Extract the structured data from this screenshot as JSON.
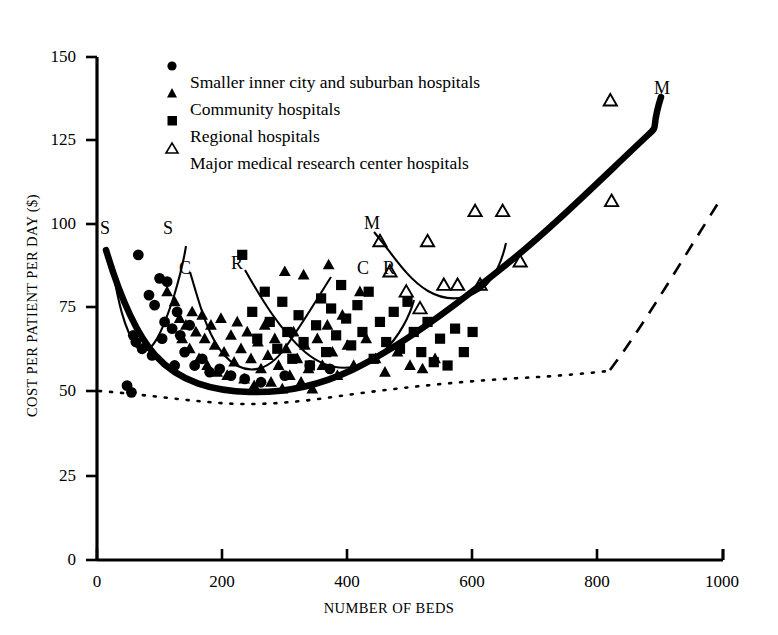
{
  "chart_data": {
    "type": "scatter",
    "title": "",
    "xlabel": "NUMBER OF BEDS",
    "ylabel": "COST PER PATIENT PER DAY ($)",
    "xlim": [
      0,
      1000
    ],
    "ylim": [
      0,
      150
    ],
    "xticks": [
      0,
      200,
      400,
      600,
      800,
      1000
    ],
    "yticks": [
      0,
      25,
      50,
      75,
      100,
      125,
      150
    ],
    "xtick_labels": [
      "0",
      "200",
      "400",
      "600",
      "800",
      "1000"
    ],
    "ytick_labels": [
      "0",
      "25",
      "50",
      "75",
      "100",
      "125",
      "150"
    ],
    "grid": false,
    "legend_position": "top-center",
    "legend": [
      {
        "marker": "filled-circle",
        "label": "Smaller inner city and suburban hospitals"
      },
      {
        "marker": "filled-triangle",
        "label": "Community hospitals"
      },
      {
        "marker": "filled-square",
        "label": "Regional hospitals"
      },
      {
        "marker": "open-triangle",
        "label": "Major medical research center hospitals"
      }
    ],
    "series": [
      {
        "name": "Smaller inner city and suburban hospitals",
        "marker": "filled-circle",
        "points": [
          [
            48,
            52
          ],
          [
            55,
            50
          ],
          [
            58,
            67
          ],
          [
            62,
            65
          ],
          [
            66,
            91
          ],
          [
            72,
            63
          ],
          [
            83,
            79
          ],
          [
            88,
            61
          ],
          [
            92,
            76
          ],
          [
            100,
            84
          ],
          [
            104,
            66
          ],
          [
            108,
            71
          ],
          [
            112,
            83
          ],
          [
            120,
            69
          ],
          [
            124,
            58
          ],
          [
            128,
            74
          ],
          [
            133,
            67
          ],
          [
            140,
            62
          ],
          [
            148,
            70
          ],
          [
            156,
            58
          ],
          [
            168,
            60
          ],
          [
            180,
            56
          ],
          [
            196,
            57
          ],
          [
            214,
            55
          ],
          [
            236,
            54
          ],
          [
            262,
            53
          ],
          [
            300,
            55
          ],
          [
            340,
            58
          ],
          [
            372,
            57
          ]
        ]
      },
      {
        "name": "Community hospitals",
        "marker": "filled-triangle",
        "points": [
          [
            112,
            80
          ],
          [
            124,
            77
          ],
          [
            132,
            72
          ],
          [
            136,
            66
          ],
          [
            142,
            70
          ],
          [
            148,
            63
          ],
          [
            152,
            74
          ],
          [
            158,
            68
          ],
          [
            163,
            60
          ],
          [
            168,
            73
          ],
          [
            172,
            66
          ],
          [
            176,
            58
          ],
          [
            182,
            70
          ],
          [
            188,
            64
          ],
          [
            192,
            56
          ],
          [
            198,
            72
          ],
          [
            203,
            62
          ],
          [
            208,
            55
          ],
          [
            214,
            67
          ],
          [
            219,
            59
          ],
          [
            224,
            71
          ],
          [
            230,
            63
          ],
          [
            235,
            54
          ],
          [
            240,
            68
          ],
          [
            246,
            60
          ],
          [
            251,
            52
          ],
          [
            257,
            65
          ],
          [
            262,
            57
          ],
          [
            268,
            70
          ],
          [
            273,
            61
          ],
          [
            278,
            53
          ],
          [
            284,
            66
          ],
          [
            290,
            58
          ],
          [
            296,
            51
          ],
          [
            302,
            63
          ],
          [
            308,
            55
          ],
          [
            314,
            68
          ],
          [
            320,
            60
          ],
          [
            326,
            53
          ],
          [
            332,
            64
          ],
          [
            338,
            57
          ],
          [
            344,
            51
          ],
          [
            352,
            66
          ],
          [
            360,
            58
          ],
          [
            368,
            70
          ],
          [
            376,
            62
          ],
          [
            384,
            55
          ],
          [
            392,
            73
          ],
          [
            400,
            64
          ],
          [
            410,
            58
          ],
          [
            420,
            80
          ],
          [
            430,
            66
          ],
          [
            445,
            60
          ],
          [
            460,
            56
          ],
          [
            480,
            62
          ],
          [
            500,
            58
          ],
          [
            520,
            57
          ],
          [
            540,
            60
          ],
          [
            300,
            86
          ],
          [
            330,
            85
          ],
          [
            370,
            88
          ]
        ]
      },
      {
        "name": "Regional hospitals",
        "marker": "filled-square",
        "points": [
          [
            232,
            91
          ],
          [
            248,
            74
          ],
          [
            256,
            66
          ],
          [
            268,
            80
          ],
          [
            276,
            71
          ],
          [
            288,
            63
          ],
          [
            296,
            77
          ],
          [
            304,
            68
          ],
          [
            312,
            60
          ],
          [
            322,
            73
          ],
          [
            330,
            65
          ],
          [
            340,
            58
          ],
          [
            350,
            70
          ],
          [
            358,
            78
          ],
          [
            366,
            62
          ],
          [
            374,
            75
          ],
          [
            382,
            67
          ],
          [
            390,
            82
          ],
          [
            398,
            72
          ],
          [
            406,
            64
          ],
          [
            416,
            76
          ],
          [
            424,
            68
          ],
          [
            434,
            80
          ],
          [
            442,
            60
          ],
          [
            452,
            71
          ],
          [
            462,
            65
          ],
          [
            474,
            74
          ],
          [
            484,
            63
          ],
          [
            496,
            77
          ],
          [
            506,
            68
          ],
          [
            518,
            62
          ],
          [
            528,
            71
          ],
          [
            538,
            59
          ],
          [
            548,
            66
          ],
          [
            560,
            58
          ],
          [
            572,
            69
          ],
          [
            586,
            62
          ],
          [
            600,
            68
          ]
        ]
      },
      {
        "name": "Major medical research center hospitals",
        "marker": "open-triangle",
        "points": [
          [
            452,
            95
          ],
          [
            468,
            86
          ],
          [
            494,
            80
          ],
          [
            516,
            75
          ],
          [
            528,
            95
          ],
          [
            554,
            82
          ],
          [
            576,
            82
          ],
          [
            604,
            104
          ],
          [
            612,
            82
          ],
          [
            648,
            104
          ],
          [
            676,
            89
          ],
          [
            820,
            137
          ],
          [
            822,
            107
          ]
        ]
      }
    ],
    "curves": [
      {
        "label": "S",
        "label_position": "upper-left",
        "description": "Smaller hospitals cost curve, U-shaped, minimum near 120 beds"
      },
      {
        "label": "C",
        "label_position": "center-left",
        "description": "Community hospitals cost curve, U-shaped, minimum near 250 beds"
      },
      {
        "label": "R",
        "label_position": "center",
        "description": "Regional hospitals cost curve, U-shaped, minimum near 330 beds"
      },
      {
        "label": "M",
        "label_position": "center-right",
        "description": "Major medical research center hospitals cost curve, U-shaped, minimum near 440 beds"
      },
      {
        "label": "",
        "description": "Heavy envelope curve (long-run average cost), minimum near 270 beds rising to 135 at 910 beds"
      },
      {
        "label": "",
        "description": "Dashed/dotted lower envelope curve rising from 50 at 0 beds to 107 at 820 beds"
      }
    ],
    "curve_labels": [
      {
        "text": "S",
        "x": 18,
        "y": 98
      },
      {
        "text": "S",
        "x": 120,
        "y": 98
      },
      {
        "text": "C",
        "x": 142,
        "y": 86
      },
      {
        "text": "R",
        "x": 222,
        "y": 88
      },
      {
        "text": "M",
        "x": 437,
        "y": 100
      },
      {
        "text": "C",
        "x": 428,
        "y": 86
      },
      {
        "text": "R",
        "x": 468,
        "y": 86
      },
      {
        "text": "M",
        "x": 905,
        "y": 140
      }
    ]
  }
}
